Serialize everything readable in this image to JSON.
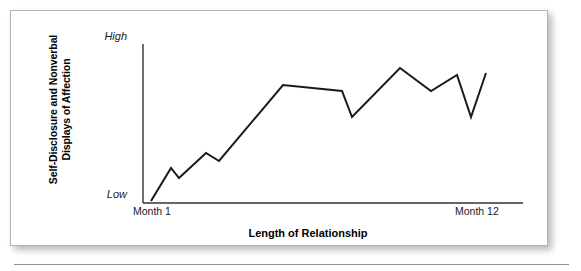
{
  "figure": {
    "background_color": "#ffffff",
    "border_color": "#b4b4b4",
    "line_color": "#1a1a1a"
  },
  "axis": {
    "y_title_line1": "Self-Disclosure and Nonverbal",
    "y_title_line2": "Displays of Affection",
    "y_tick_high": "High",
    "y_tick_low": "Low",
    "x_tick_left": "Month 1",
    "x_tick_right": "Month 12",
    "x_title": "Length of Relationship"
  },
  "caption": {
    "trailing_text": ""
  },
  "chart_data": {
    "type": "line",
    "title": "",
    "xlabel": "Length of Relationship",
    "ylabel": "Self-Disclosure and Nonverbal Displays of Affection",
    "xlim": [
      0,
      12
    ],
    "ylim": [
      0,
      10
    ],
    "x_tick_labels": [
      "Month 1",
      "Month 12"
    ],
    "y_tick_labels": [
      "Low",
      "High"
    ],
    "grid": false,
    "legend": false,
    "series": [
      {
        "name": "Self-Disclosure and Nonverbal Displays of Affection",
        "color": "#1a1a1a",
        "x": [
          0.3,
          1.0,
          1.3,
          2.26,
          2.72,
          4.96,
          7.02,
          7.36,
          9.03,
          10.11,
          11.0,
          11.5,
          12.0
        ],
        "values": [
          0.13,
          2.22,
          1.59,
          3.18,
          2.68,
          7.45,
          7.06,
          5.41,
          8.56,
          7.06,
          8.09,
          5.41,
          8.37
        ],
        "pixel_points": [
          [
            140,
            190
          ],
          [
            160,
            157
          ],
          [
            168,
            167
          ],
          [
            195,
            142
          ],
          [
            208,
            150
          ],
          [
            272,
            74
          ],
          [
            331,
            80
          ],
          [
            341,
            106
          ],
          [
            389,
            57
          ],
          [
            420,
            80
          ],
          [
            446,
            64
          ],
          [
            460,
            106
          ],
          [
            475,
            62
          ]
        ]
      }
    ],
    "axis_pixel_geometry": {
      "x_axis_y": 192,
      "y_axis_x": 132,
      "x_axis_left": 132,
      "x_axis_right": 512,
      "y_axis_top": 33,
      "y_axis_bottom": 192
    }
  }
}
